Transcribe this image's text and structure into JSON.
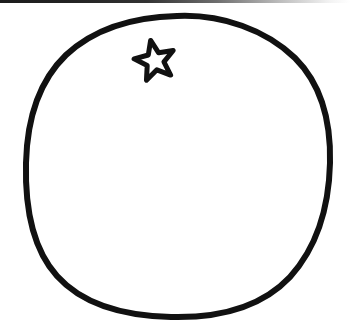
{
  "image": {
    "title": "Hand-drawn citrus fruit line art",
    "subject": "orange",
    "style": "black ink outline drawing, coloring-book style",
    "width": 350,
    "height": 331,
    "background_color": "#ffffff",
    "ink_color": "#111111"
  },
  "artifacts": {
    "top_scan_edge": {
      "name": "scan-edge-artifact",
      "description": "thin dark horizontal scanner edge line fading left to right",
      "color": "#1c1c1c",
      "height_px": 3
    }
  },
  "elements": {
    "fruit_outline": {
      "name": "fruit-outline",
      "description": "irregular hand-drawn closed circle forming the body of the fruit",
      "stroke_color": "#111111",
      "stroke_width": 6,
      "fill_color": "#ffffff",
      "center_x": 177,
      "center_y": 166,
      "radius_x": 152,
      "radius_y": 149,
      "path": "M 177 16 C 222 14 266 30 295 58 C 322 85 331 124 330 163 C 329 204 318 246 290 277 C 259 310 212 318 171 317 C 128 316 84 306 57 276 C 30 246 25 203 26 163 C 27 122 37 83 66 55 C 95 28 135 17 177 16 Z"
    },
    "calyx_star": {
      "name": "calyx-star",
      "description": "five-pointed star outline representing the stem end of the fruit",
      "stroke_color": "#111111",
      "stroke_width": 5,
      "fill_color": "#ffffff",
      "center_x": 155,
      "center_y": 61,
      "outer_radius": 21,
      "inner_radius": 9,
      "points": 5,
      "rotation_deg": -12
    },
    "dimples": {
      "name": "peel-dimples",
      "description": "small crescent shaped pore marks clustered on the right side and lower area of the peel",
      "color": "#111111",
      "count": 35,
      "shape": "crescent",
      "marks": [
        {
          "x": 221,
          "y": 49,
          "size": 8,
          "rotation": 170
        },
        {
          "x": 254,
          "y": 70,
          "size": 9,
          "rotation": 205
        },
        {
          "x": 278,
          "y": 93,
          "size": 9,
          "rotation": 215
        },
        {
          "x": 242,
          "y": 117,
          "size": 9,
          "rotation": 240
        },
        {
          "x": 291,
          "y": 125,
          "size": 9,
          "rotation": 215
        },
        {
          "x": 317,
          "y": 124,
          "size": 8,
          "rotation": 205
        },
        {
          "x": 279,
          "y": 140,
          "size": 8,
          "rotation": 200
        },
        {
          "x": 299,
          "y": 151,
          "size": 9,
          "rotation": 235
        },
        {
          "x": 327,
          "y": 155,
          "size": 8,
          "rotation": 205
        },
        {
          "x": 277,
          "y": 165,
          "size": 9,
          "rotation": 200
        },
        {
          "x": 306,
          "y": 172,
          "size": 9,
          "rotation": 230
        },
        {
          "x": 322,
          "y": 169,
          "size": 8,
          "rotation": 210
        },
        {
          "x": 279,
          "y": 182,
          "size": 8,
          "rotation": 205
        },
        {
          "x": 302,
          "y": 190,
          "size": 9,
          "rotation": 230
        },
        {
          "x": 324,
          "y": 186,
          "size": 8,
          "rotation": 215
        },
        {
          "x": 288,
          "y": 202,
          "size": 9,
          "rotation": 230
        },
        {
          "x": 310,
          "y": 203,
          "size": 9,
          "rotation": 225
        },
        {
          "x": 192,
          "y": 212,
          "size": 9,
          "rotation": 195
        },
        {
          "x": 300,
          "y": 222,
          "size": 9,
          "rotation": 235
        },
        {
          "x": 222,
          "y": 240,
          "size": 10,
          "rotation": 210
        },
        {
          "x": 196,
          "y": 249,
          "size": 9,
          "rotation": 190
        },
        {
          "x": 248,
          "y": 250,
          "size": 9,
          "rotation": 250
        },
        {
          "x": 274,
          "y": 249,
          "size": 9,
          "rotation": 255
        },
        {
          "x": 297,
          "y": 243,
          "size": 8,
          "rotation": 245
        },
        {
          "x": 238,
          "y": 262,
          "size": 9,
          "rotation": 245
        },
        {
          "x": 266,
          "y": 266,
          "size": 9,
          "rotation": 255
        },
        {
          "x": 170,
          "y": 275,
          "size": 9,
          "rotation": 235
        },
        {
          "x": 200,
          "y": 283,
          "size": 8,
          "rotation": 250
        },
        {
          "x": 232,
          "y": 273,
          "size": 9,
          "rotation": 250
        },
        {
          "x": 312,
          "y": 232,
          "size": 8,
          "rotation": 240
        },
        {
          "x": 264,
          "y": 232,
          "size": 8,
          "rotation": 245
        },
        {
          "x": 286,
          "y": 222,
          "size": 8,
          "rotation": 235
        },
        {
          "x": 212,
          "y": 228,
          "size": 8,
          "rotation": 215
        },
        {
          "x": 330,
          "y": 200,
          "size": 7,
          "rotation": 220
        },
        {
          "x": 262,
          "y": 196,
          "size": 7,
          "rotation": 230
        }
      ]
    }
  }
}
